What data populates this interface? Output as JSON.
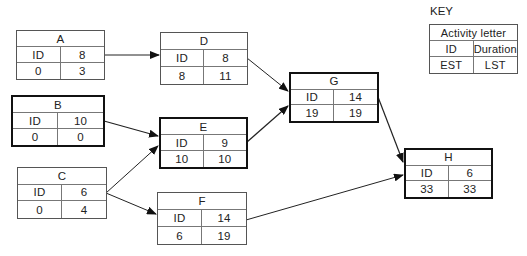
{
  "key": {
    "label": "KEY",
    "title": "Activity letter",
    "top_left": "ID",
    "top_right": "Duration",
    "bottom_left": "EST",
    "bottom_right": "LST"
  },
  "nodes": {
    "A": {
      "letter": "A",
      "id": "ID",
      "duration": "8",
      "est": "0",
      "lst": "3",
      "critical": false
    },
    "B": {
      "letter": "B",
      "id": "ID",
      "duration": "10",
      "est": "0",
      "lst": "0",
      "critical": true
    },
    "C": {
      "letter": "C",
      "id": "ID",
      "duration": "6",
      "est": "0",
      "lst": "4",
      "critical": false
    },
    "D": {
      "letter": "D",
      "id": "ID",
      "duration": "8",
      "est": "8",
      "lst": "11",
      "critical": false
    },
    "E": {
      "letter": "E",
      "id": "ID",
      "duration": "9",
      "est": "10",
      "lst": "10",
      "critical": true
    },
    "F": {
      "letter": "F",
      "id": "ID",
      "duration": "14",
      "est": "6",
      "lst": "19",
      "critical": false
    },
    "G": {
      "letter": "G",
      "id": "ID",
      "duration": "14",
      "est": "19",
      "lst": "19",
      "critical": true
    },
    "H": {
      "letter": "H",
      "id": "ID",
      "duration": "6",
      "est": "33",
      "lst": "33",
      "critical": true
    }
  },
  "edges": [
    {
      "from": "A",
      "to": "D"
    },
    {
      "from": "B",
      "to": "E"
    },
    {
      "from": "C",
      "to": "E"
    },
    {
      "from": "C",
      "to": "F"
    },
    {
      "from": "D",
      "to": "G"
    },
    {
      "from": "E",
      "to": "G"
    },
    {
      "from": "G",
      "to": "H"
    },
    {
      "from": "F",
      "to": "H"
    }
  ],
  "colors": {
    "line": "#222222",
    "border": "#555555",
    "critical_border": "#111111"
  }
}
